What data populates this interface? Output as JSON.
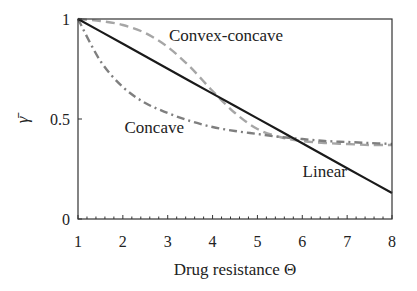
{
  "chart_data": {
    "type": "line",
    "title": "",
    "xlabel": "Drug resistance Θ",
    "ylabel": "γ̄",
    "xlim": [
      1,
      8
    ],
    "ylim": [
      0,
      1
    ],
    "x_ticks": [
      "1",
      "2",
      "3",
      "4",
      "5",
      "6",
      "7",
      "8"
    ],
    "y_ticks": [
      "0",
      "0.5",
      "1"
    ],
    "x_minor_tick_step": 0.2,
    "grid": false,
    "legend": "none (inline curve labels)",
    "x": [
      1,
      1.5,
      2,
      2.5,
      3,
      3.5,
      4,
      4.5,
      5,
      5.5,
      6,
      6.5,
      7,
      7.5,
      8
    ],
    "series": [
      {
        "name": "Linear",
        "style": "solid",
        "color": "#1a1a1a",
        "values": [
          1.0,
          0.938,
          0.876,
          0.814,
          0.751,
          0.689,
          0.627,
          0.565,
          0.503,
          0.441,
          0.379,
          0.316,
          0.254,
          0.192,
          0.13
        ]
      },
      {
        "name": "Convex-concave",
        "style": "dashed",
        "color": "#a6a6a6",
        "values": [
          1.0,
          0.99,
          0.97,
          0.93,
          0.86,
          0.76,
          0.64,
          0.53,
          0.45,
          0.41,
          0.39,
          0.38,
          0.375,
          0.37,
          0.37
        ]
      },
      {
        "name": "Concave",
        "style": "dash-dot",
        "color": "#7f7f7f",
        "values": [
          1.0,
          0.79,
          0.66,
          0.58,
          0.53,
          0.49,
          0.46,
          0.44,
          0.425,
          0.41,
          0.4,
          0.39,
          0.385,
          0.38,
          0.375
        ]
      }
    ],
    "annotations": [
      {
        "text": "Convex-concave",
        "x": 4.3,
        "y": 0.92
      },
      {
        "text": "Concave",
        "x": 2.7,
        "y": 0.46
      },
      {
        "text": "Linear",
        "x": 6.5,
        "y": 0.24
      }
    ]
  }
}
